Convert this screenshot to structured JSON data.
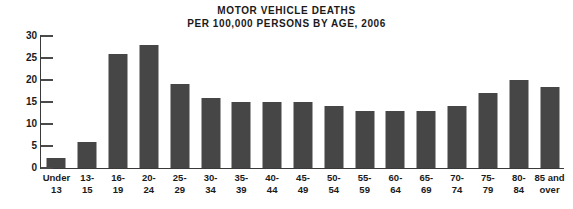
{
  "chart_data": {
    "type": "bar",
    "title": "MOTOR VEHICLE DEATHS PER 100,000 PERSONS BY AGE, 2006",
    "title_lines": [
      "MOTOR VEHICLE DEATHS",
      "PER 100,000 PERSONS BY AGE, 2006"
    ],
    "xlabel": "",
    "ylabel": "",
    "ylim": [
      0,
      30
    ],
    "yticks": [
      0,
      5,
      10,
      15,
      20,
      25,
      30
    ],
    "ytick_labels": [
      "0",
      "5",
      "10",
      "15",
      "20",
      "25",
      "30"
    ],
    "grid": false,
    "legend": false,
    "bar_color": "#464646",
    "axis_color": "#3a3a3a",
    "categories": [
      "Under 13",
      "13-15",
      "16-19",
      "20-24",
      "25-29",
      "30-34",
      "35-39",
      "40-44",
      "45-49",
      "50-54",
      "55-59",
      "60-64",
      "65-69",
      "70-74",
      "75-79",
      "80-84",
      "85 and over"
    ],
    "category_lines": [
      [
        "Under",
        "13"
      ],
      [
        "13-",
        "15"
      ],
      [
        "16-",
        "19"
      ],
      [
        "20-",
        "24"
      ],
      [
        "25-",
        "29"
      ],
      [
        "30-",
        "34"
      ],
      [
        "35-",
        "39"
      ],
      [
        "40-",
        "44"
      ],
      [
        "45-",
        "49"
      ],
      [
        "50-",
        "54"
      ],
      [
        "55-",
        "59"
      ],
      [
        "60-",
        "64"
      ],
      [
        "65-",
        "69"
      ],
      [
        "70-",
        "74"
      ],
      [
        "75-",
        "79"
      ],
      [
        "80-",
        "84"
      ],
      [
        "85 and",
        "over"
      ]
    ],
    "values": [
      2.3,
      6,
      26,
      28,
      19,
      16,
      15,
      15,
      15,
      14,
      13,
      13,
      13,
      14,
      17,
      20,
      18.5
    ]
  }
}
